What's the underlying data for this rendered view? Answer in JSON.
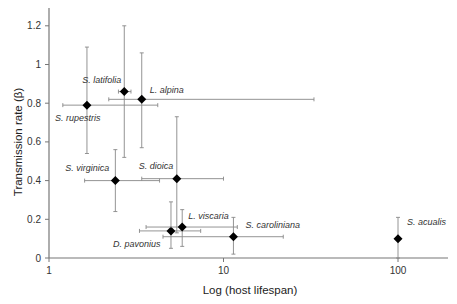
{
  "chart_data": {
    "type": "scatter",
    "title": "",
    "xlabel": "Log (host lifespan)",
    "ylabel": "Transmission rate (β)",
    "xscale": "log",
    "xlim": [
      1,
      200
    ],
    "ylim": [
      0,
      1.3
    ],
    "xticks": [
      1,
      10,
      100
    ],
    "xtick_labels": [
      "1",
      "10",
      "100"
    ],
    "yticks": [
      0,
      0.2,
      0.4,
      0.6,
      0.8,
      1,
      1.2
    ],
    "ytick_labels": [
      "0",
      "0.2",
      "0.4",
      "0.6",
      "0.8",
      "1",
      "1.2"
    ],
    "grid": false,
    "marker": "diamond",
    "points": [
      {
        "name": "S. rupestris",
        "x": 1.65,
        "y": 0.79,
        "xerr": [
          1.2,
          4.2
        ],
        "yerr": [
          0.54,
          1.09
        ],
        "label_dx": -32,
        "label_dy": 16
      },
      {
        "name": "S. latifolia",
        "x": 2.7,
        "y": 0.86,
        "xerr": [
          2.5,
          2.95
        ],
        "yerr": [
          0.52,
          1.2
        ],
        "label_dx": -42,
        "label_dy": -9
      },
      {
        "name": "L. alpina",
        "x": 3.4,
        "y": 0.82,
        "xerr": [
          2.2,
          33
        ],
        "yerr": [
          0.57,
          1.06
        ],
        "label_dx": 8,
        "label_dy": -6
      },
      {
        "name": "S. virginica",
        "x": 2.4,
        "y": 0.4,
        "xerr": [
          1.6,
          4.3
        ],
        "yerr": [
          0.24,
          0.56
        ],
        "label_dx": -50,
        "label_dy": -10
      },
      {
        "name": "S. dioica",
        "x": 5.4,
        "y": 0.41,
        "xerr": [
          3.4,
          10.0
        ],
        "yerr": [
          0.13,
          0.73
        ],
        "label_dx": -38,
        "label_dy": -10
      },
      {
        "name": "D. pavonius",
        "x": 5.0,
        "y": 0.14,
        "xerr": [
          3.3,
          7.4
        ],
        "yerr": [
          0.05,
          0.29
        ],
        "label_dx": -58,
        "label_dy": 16
      },
      {
        "name": "L. viscaria",
        "x": 5.8,
        "y": 0.16,
        "xerr": [
          3.6,
          12.0
        ],
        "yerr": [
          0.06,
          0.25
        ],
        "label_dx": 6,
        "label_dy": -8
      },
      {
        "name": "S. caroliniana",
        "x": 11.4,
        "y": 0.11,
        "xerr": [
          4.5,
          22
        ],
        "yerr": [
          0.02,
          0.21
        ],
        "label_dx": 12,
        "label_dy": -9
      },
      {
        "name": "S. acualis",
        "x": 100,
        "y": 0.1,
        "xerr": [
          100,
          100
        ],
        "yerr": [
          0.0,
          0.21
        ],
        "label_dx": 9,
        "label_dy": -14
      }
    ]
  }
}
